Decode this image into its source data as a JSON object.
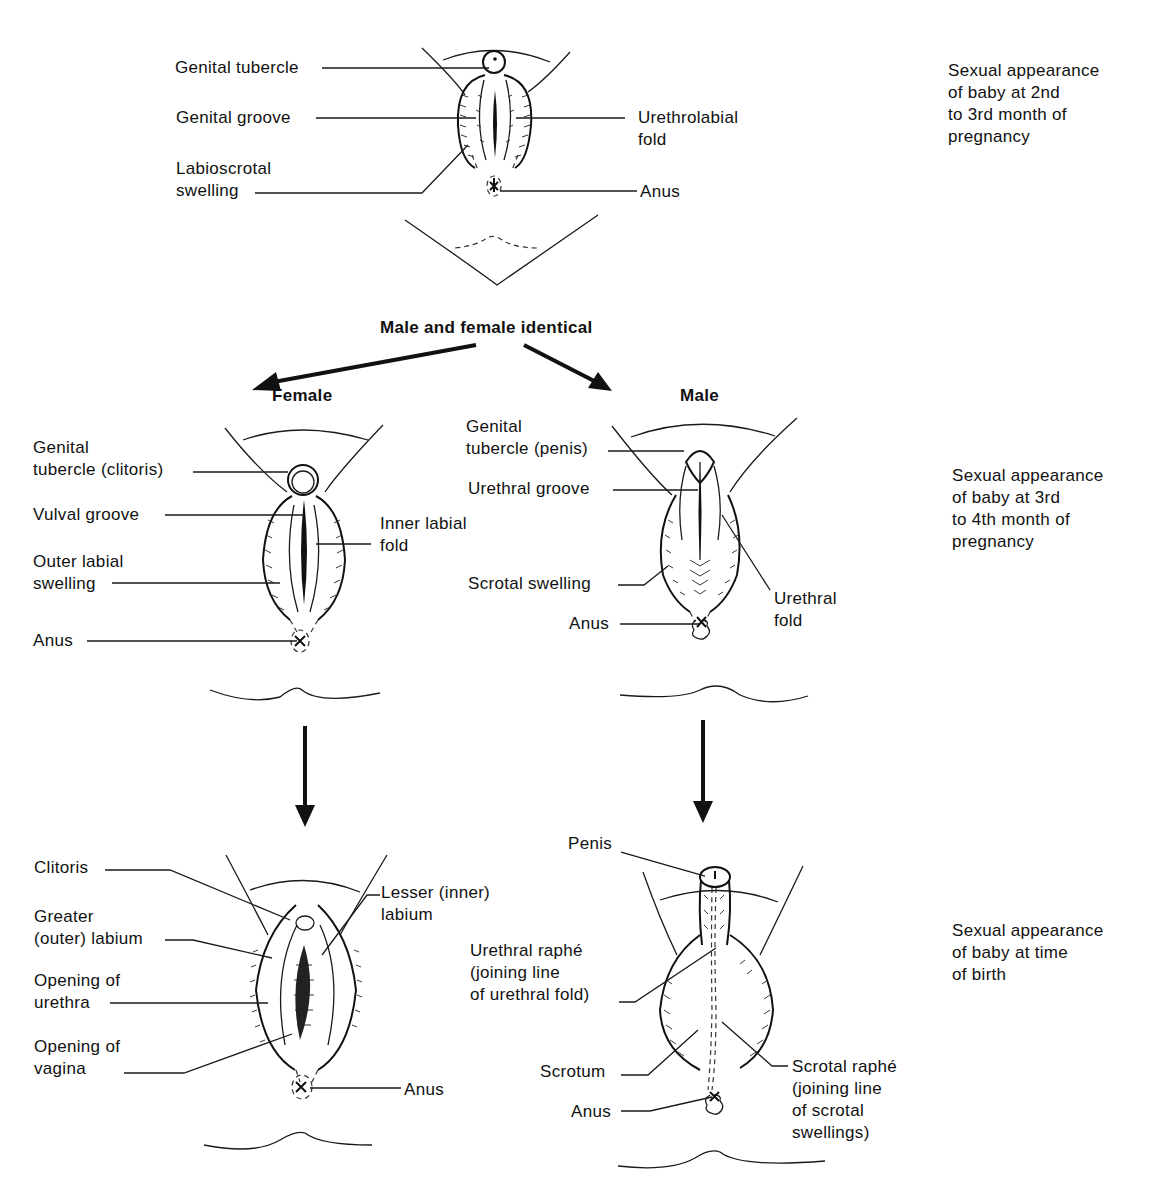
{
  "figure": {
    "center_heading": "Male and female identical",
    "branches": {
      "female_label": "Female",
      "male_label": "Male"
    },
    "stages": [
      {
        "note": "Sexual appearance\nof baby at 2nd\nto 3rd month of\npregnancy",
        "labels": {
          "genital_tubercle": "Genital tubercle",
          "genital_groove": "Genital groove",
          "labioscrotal_swelling": "Labioscrotal\nswelling",
          "urethrolabial_fold": "Urethrolabial\nfold",
          "anus": "Anus"
        }
      },
      {
        "note": "Sexual appearance\nof baby at 3rd\nto 4th month of\npregnancy",
        "female_labels": {
          "genital_tubercle_clitoris": "Genital\ntubercle (clitoris)",
          "vulval_groove": "Vulval groove",
          "outer_labial_swelling": "Outer labial\nswelling",
          "inner_labial_fold": "Inner labial\nfold",
          "anus": "Anus"
        },
        "male_labels": {
          "genital_tubercle_penis": "Genital\ntubercle (penis)",
          "urethral_groove": "Urethral groove",
          "scrotal_swelling": "Scrotal swelling",
          "urethral_fold": "Urethral\nfold",
          "anus": "Anus"
        }
      },
      {
        "note": "Sexual appearance\nof baby at time\nof birth",
        "female_labels": {
          "clitoris": "Clitoris",
          "greater_labium": "Greater\n(outer) labium",
          "opening_urethra": "Opening of\nurethra",
          "opening_vagina": "Opening of\nvagina",
          "lesser_labium": "Lesser (inner)\nlabium",
          "anus": "Anus"
        },
        "male_labels": {
          "penis": "Penis",
          "urethral_raphe": "Urethral raphé\n(joining line\nof urethral fold)",
          "scrotum": "Scrotum",
          "anus": "Anus",
          "scrotal_raphe": "Scrotal raphé\n(joining line\nof scrotal\nswellings)"
        }
      }
    ],
    "colors": {
      "ink": "#111111",
      "background": "#ffffff"
    }
  }
}
